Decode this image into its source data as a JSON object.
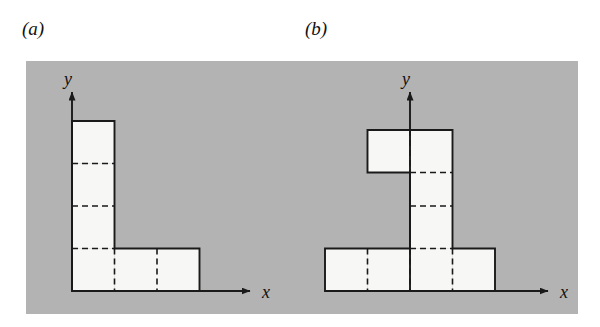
{
  "figure": {
    "title": "",
    "background_color": "#ffffff",
    "panel_fill_color": "#b4b4b4",
    "cell_fill_color": "#f7f7f5",
    "outline_color": "#1a1a1a",
    "dashed_color": "#1a1a1a",
    "axis_color": "#1a1a1a",
    "panels": [
      {
        "id": "a",
        "label": "(a)",
        "axis_x_label": "x",
        "axis_y_label": "y",
        "shape_name": "L-shaped polyomino",
        "cell_count": 6,
        "cells": [
          {
            "col": 0,
            "row": 0
          },
          {
            "col": 1,
            "row": 0
          },
          {
            "col": 2,
            "row": 0
          },
          {
            "col": 0,
            "row": 1
          },
          {
            "col": 0,
            "row": 2
          },
          {
            "col": 0,
            "row": 3
          }
        ]
      },
      {
        "id": "b",
        "label": "(b)",
        "axis_x_label": "x",
        "axis_y_label": "y",
        "shape_name": "T-shaped polyomino with offset top arm",
        "cell_count": 8,
        "cells": [
          {
            "col": -2,
            "row": 0
          },
          {
            "col": -1,
            "row": 0
          },
          {
            "col": 0,
            "row": 0
          },
          {
            "col": 1,
            "row": 0
          },
          {
            "col": 0,
            "row": 1
          },
          {
            "col": 0,
            "row": 2
          },
          {
            "col": 0,
            "row": 3
          },
          {
            "col": -1,
            "row": 3
          }
        ]
      }
    ]
  }
}
